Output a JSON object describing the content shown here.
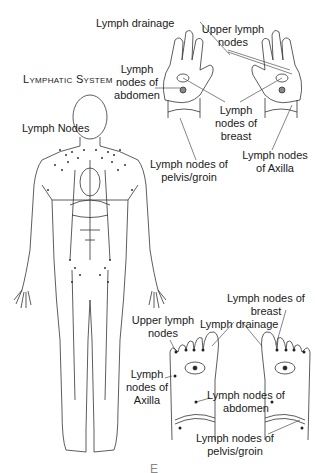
{
  "title": "Lymphatic System",
  "body_figure": {
    "labels": {
      "lymph_nodes": "Lymph Nodes"
    }
  },
  "hands_figure": {
    "labels": {
      "lymph_drainage": "Lymph drainage",
      "upper_lymph_nodes": "Upper lymph nodes",
      "abdomen": "Lymph nodes of abdomen",
      "breast": "Lymph nodes of breast",
      "pelvis_groin": "Lymph nodes of pelvis/groin",
      "axilla": "Lymph nodes of Axilla"
    }
  },
  "feet_figure": {
    "labels": {
      "breast": "Lymph nodes of breast",
      "upper_lymph_nodes": "Upper lymph nodes",
      "lymph_drainage": "Lymph drainage",
      "axilla": "Lymph nodes of Axilla",
      "abdomen": "Lymph nodes of abdomen",
      "pelvis_groin": "Lymph nodes of pelvis/groin"
    }
  },
  "footer_text": "E"
}
